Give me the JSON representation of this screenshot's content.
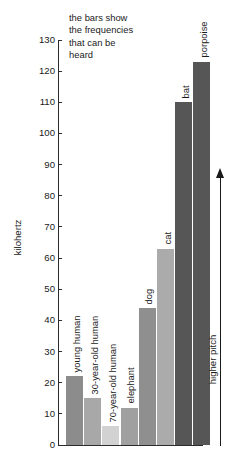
{
  "caption": "the bars show\nthe frequencies\nthat can be\nheard",
  "annotation": {
    "arrow_label": "higher pitch",
    "arrow_direction": "up",
    "arrow_icon": "up-arrow-icon"
  },
  "chart_data": {
    "type": "bar",
    "title": "the bars show the frequencies that can be heard",
    "xlabel": "",
    "ylabel": "kilohertz",
    "ylim": [
      0,
      130
    ],
    "ytick_step": 10,
    "yticks": [
      0,
      10,
      20,
      30,
      40,
      50,
      60,
      70,
      80,
      90,
      100,
      110,
      120,
      130
    ],
    "ytick_labels": [
      "0",
      "10",
      "20",
      "30",
      "40",
      "50",
      "60",
      "70",
      "80",
      "90",
      "100",
      "110",
      "120",
      "130"
    ],
    "grid": false,
    "legend": null,
    "units": "kilohertz",
    "categories": [
      "young human",
      "30-year-old human",
      "70-year-old human",
      "elephant",
      "dog",
      "cat",
      "bat",
      "porpoise"
    ],
    "values": [
      22,
      15,
      6,
      12,
      44,
      63,
      110,
      123
    ],
    "bars": [
      {
        "label": "young human",
        "value": 22,
        "color": "#8c8c8c"
      },
      {
        "label": "30-year-old human",
        "value": 15,
        "color": "#a8a8a8"
      },
      {
        "label": "70-year-old human",
        "value": 6,
        "color": "#d2d2d2"
      },
      {
        "label": "elephant",
        "value": 12,
        "color": "#a0a0a0"
      },
      {
        "label": "dog",
        "value": 44,
        "color": "#8f8f8f"
      },
      {
        "label": "cat",
        "value": 63,
        "color": "#ababab"
      },
      {
        "label": "bat",
        "value": 110,
        "color": "#565656"
      },
      {
        "label": "porpoise",
        "value": 123,
        "color": "#565656"
      }
    ],
    "annotations": [
      {
        "text": "higher pitch",
        "orientation": "vertical",
        "arrow": "up"
      }
    ]
  },
  "colors": {
    "axis": "#2b2b2b",
    "text": "#1a1a1a",
    "background": "#ffffff"
  }
}
